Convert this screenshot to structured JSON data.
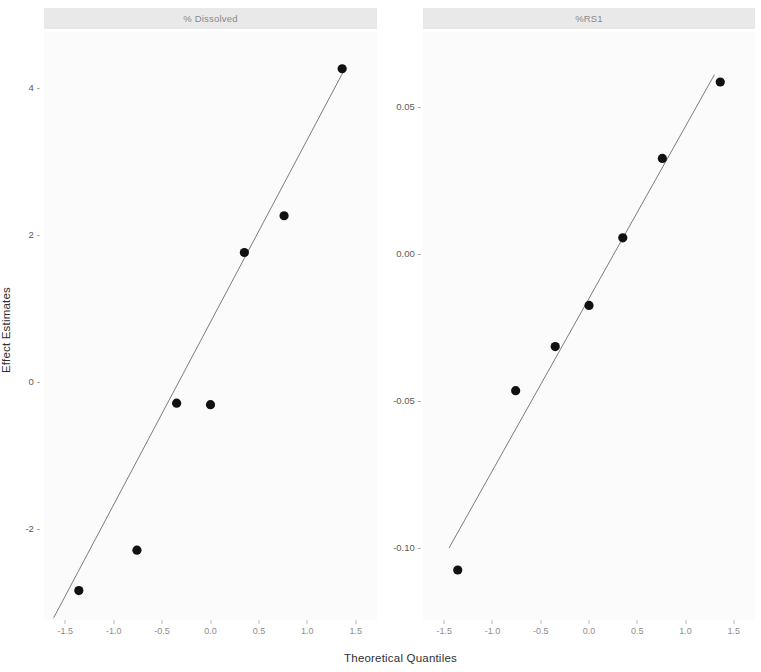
{
  "figure": {
    "width": 761,
    "height": 672,
    "background": "#ffffff",
    "panel_background": "#fbfbfb",
    "strip_background": "#e9e9e9",
    "point_color": "#111111",
    "line_color": "#6d6d6d"
  },
  "axis_titles": {
    "x": "Theoretical Quantiles",
    "y": "Effect Estimates"
  },
  "x_ticks": [
    "-1.5",
    "-1.0",
    "-0.5",
    "0.0",
    "0.5",
    "1.0",
    "1.5"
  ],
  "x_tick_values": [
    -1.5,
    -1.0,
    -0.5,
    0.0,
    0.5,
    1.0,
    1.5
  ],
  "panels": [
    {
      "strip_label": "% Dissolved",
      "y_ticks": [
        "4",
        "2",
        "0",
        "-2"
      ],
      "y_tick_values": [
        4,
        2,
        0,
        -2
      ]
    },
    {
      "strip_label": "%RS1",
      "y_ticks": [
        "0.05",
        "0.00",
        "-0.05",
        "-0.10"
      ],
      "y_tick_values": [
        0.05,
        0.0,
        -0.05,
        -0.1
      ]
    }
  ],
  "chart_data": {
    "type": "scatter",
    "title": "",
    "subtitle": "",
    "xlabel": "Theoretical Quantiles",
    "ylabel": "Effect Estimates",
    "grid": false,
    "legend": "none",
    "facets": [
      {
        "name": "% Dissolved",
        "xlim": [
          -1.72,
          1.72
        ],
        "ylim": [
          -3.25,
          4.75
        ],
        "xticks": [
          -1.5,
          -1.0,
          -0.5,
          0.0,
          0.5,
          1.0,
          1.5
        ],
        "yticks": [
          -2,
          0,
          2,
          4
        ],
        "x": [
          -1.36,
          -0.76,
          -0.35,
          0.0,
          0.35,
          0.76,
          1.36
        ],
        "y": [
          -2.85,
          -2.3,
          -0.3,
          -0.32,
          1.75,
          2.25,
          4.25
        ],
        "reference_line": {
          "type": "qq-line",
          "x": [
            -1.62,
            1.38
          ],
          "y": [
            -3.22,
            4.23
          ]
        }
      },
      {
        "name": "%RS1",
        "xlim": [
          -1.72,
          1.72
        ],
        "ylim": [
          -0.125,
          0.075
        ],
        "xticks": [
          -1.5,
          -1.0,
          -0.5,
          0.0,
          0.5,
          1.0,
          1.5
        ],
        "yticks": [
          -0.1,
          -0.05,
          0.0,
          0.05
        ],
        "x": [
          -1.36,
          -0.76,
          -0.35,
          0.0,
          0.35,
          0.76,
          1.36
        ],
        "y": [
          -0.108,
          -0.047,
          -0.032,
          -0.018,
          0.005,
          0.032,
          0.058
        ],
        "reference_line": {
          "type": "qq-line",
          "x": [
            -1.45,
            1.3
          ],
          "y": [
            -0.1005,
            0.0605
          ]
        }
      }
    ]
  }
}
